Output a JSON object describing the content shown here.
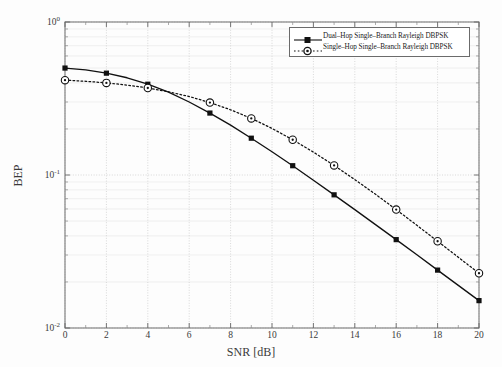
{
  "chart_data": {
    "type": "line",
    "title": "",
    "xlabel": "SNR [dB]",
    "ylabel": "BEP",
    "xlim": [
      0,
      20
    ],
    "ylim": [
      0.01,
      1
    ],
    "yscale": "log",
    "xscale": "linear",
    "grid": true,
    "legend_position": "top-right",
    "xticks": [
      "0",
      "2",
      "4",
      "6",
      "8",
      "10",
      "12",
      "14",
      "16",
      "18",
      "20"
    ],
    "xtick_values": [
      0,
      2,
      4,
      6,
      8,
      10,
      12,
      14,
      16,
      18,
      20
    ],
    "yticks": [
      "10^0",
      "10^-1",
      "10^-2"
    ],
    "ytick_values": [
      1,
      0.1,
      0.01
    ],
    "ytick_exponents": [
      "0",
      "-1",
      "-2"
    ],
    "series": [
      {
        "name": "Dual-Hop Single-Branch Rayleigh DBPSK",
        "marker": "filled-square",
        "linestyle": "solid",
        "color": "#111111",
        "x": [
          0,
          1,
          2,
          3,
          4,
          5,
          6,
          7,
          8,
          9,
          10,
          11,
          12,
          13,
          14,
          15,
          16,
          17,
          18,
          19,
          20
        ],
        "y": [
          0.5,
          0.486,
          0.463,
          0.432,
          0.392,
          0.348,
          0.3,
          0.254,
          0.212,
          0.174,
          0.142,
          0.115,
          0.0925,
          0.0742,
          0.0594,
          0.0474,
          0.0378,
          0.0301,
          0.0239,
          0.019,
          0.0151
        ],
        "marker_x": [
          0,
          2,
          4,
          7,
          9,
          11,
          13,
          16,
          18,
          20
        ],
        "marker_y": [
          0.5,
          0.463,
          0.392,
          0.254,
          0.174,
          0.115,
          0.0742,
          0.0378,
          0.0239,
          0.0151
        ]
      },
      {
        "name": "Single-Hop Single-Branch Rayleigh DBPSK",
        "marker": "open-circle",
        "linestyle": "dotted",
        "color": "#111111",
        "x": [
          0,
          1,
          2,
          3,
          4,
          5,
          6,
          7,
          8,
          9,
          10,
          11,
          12,
          13,
          14,
          15,
          16,
          17,
          18,
          19,
          20
        ],
        "y": [
          0.4167,
          0.4098,
          0.4,
          0.387,
          0.3704,
          0.35,
          0.3256,
          0.2976,
          0.2668,
          0.2344,
          0.2016,
          0.17,
          0.1411,
          0.1155,
          0.0934,
          0.0748,
          0.0594,
          0.0469,
          0.0369,
          0.029,
          0.0228
        ]
      }
    ]
  },
  "legend": {
    "items": [
      {
        "label": "Dual–Hop Single–Branch Rayleigh DBPSK",
        "style": "solid-square"
      },
      {
        "label": "Single–Hop Single–Branch Rayleigh DBPSK",
        "style": "dotted-circle"
      }
    ]
  }
}
